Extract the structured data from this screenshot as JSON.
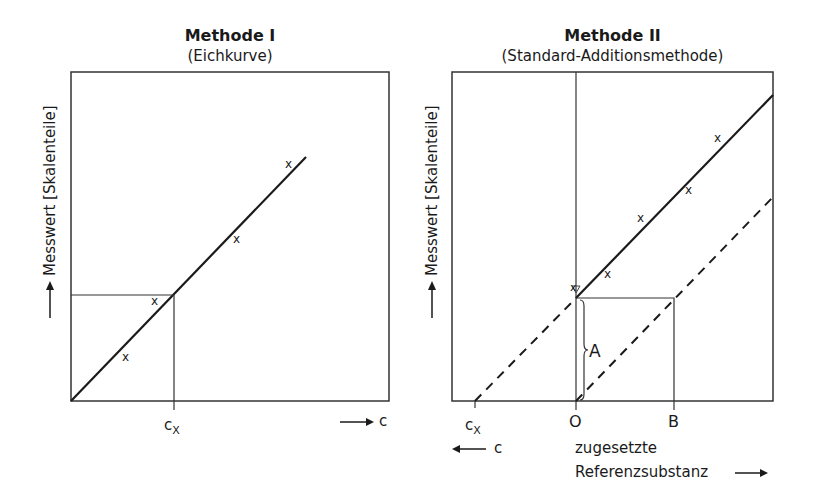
{
  "panels": [
    {
      "title": "Methode I",
      "subtitle": "(Eichkurve)",
      "ylabel": "Messwert [Skalenteile]",
      "x_marker_label_main": "c",
      "x_marker_label_sub": "X",
      "x_axis_label": "c",
      "points_marker": "x"
    },
    {
      "title": "Methode II",
      "subtitle": "(Standard-Additionsmethode)",
      "ylabel": "Messwert [Skalenteile]",
      "cx_label_main": "c",
      "cx_label_sub": "X",
      "origin_label": "O",
      "b_label": "B",
      "a_label": "A",
      "neg_axis_label": "c",
      "added_label_line1": "zugesetzte",
      "added_label_line2": "Referenzsubstanz",
      "points_marker": "x"
    }
  ],
  "colors": {
    "line": "#1a1a1a",
    "frame": "#333333",
    "marker": "#444444"
  }
}
